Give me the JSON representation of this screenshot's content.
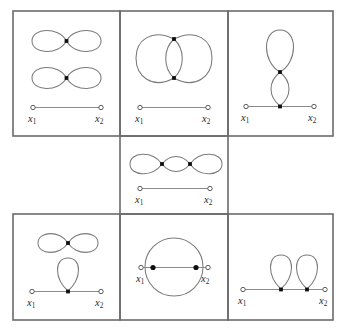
{
  "figure": {
    "background_color": "#ffffff",
    "border_color": "#6b6b6b",
    "curve_color": "#7a7a7a",
    "axis_color": "#8a8a8a",
    "filled_node_color": "#101010",
    "open_node_fill": "#ffffff",
    "open_node_stroke": "#4a4a4a",
    "width": 347,
    "height": 333,
    "grid": {
      "columns": 3,
      "rows": 3,
      "middle_row_occupied_cells": 1
    }
  },
  "labels": {
    "x1": {
      "symbol": "x",
      "subscript": "1"
    },
    "x2": {
      "symbol": "x",
      "subscript": "2"
    }
  },
  "panels": [
    {
      "id": "panel-top-left",
      "position": "row1-col1",
      "description": "Two stacked horizontal figure-eight loops, each with a single node at its crossing point, above an interval with open endpoints.",
      "filled_nodes": 2,
      "loops": 4,
      "axis": {
        "left_label": "x1",
        "right_label": "x2",
        "nodes_on_axis": 0
      }
    },
    {
      "id": "panel-top-middle",
      "position": "row1-col2",
      "description": "Two large vertical ovals meeting at two vertically stacked nodes, above an interval with open endpoints.",
      "filled_nodes": 2,
      "loops": 2,
      "axis": {
        "left_label": "x1",
        "right_label": "x2",
        "nodes_on_axis": 0
      }
    },
    {
      "id": "panel-top-right",
      "position": "row1-col3",
      "description": "Vertical chain: a teardrop loop on top joined at a node to a lens shape whose lower node sits on the interval.",
      "filled_nodes": 2,
      "loops": 2,
      "axis": {
        "left_label": "x1",
        "right_label": "x2",
        "nodes_on_axis": 1
      }
    },
    {
      "id": "panel-middle-center",
      "position": "row2-col2",
      "description": "Horizontal chain of three loops joined at two nodes, above an interval with open endpoints.",
      "filled_nodes": 2,
      "loops": 3,
      "axis": {
        "left_label": "x1",
        "right_label": "x2",
        "nodes_on_axis": 0
      }
    },
    {
      "id": "panel-bottom-left",
      "position": "row3-col1",
      "description": "A detached horizontal figure-eight above a single teardrop loop attached to a node on the interval.",
      "filled_nodes": 2,
      "loops": 3,
      "axis": {
        "left_label": "x1",
        "right_label": "x2",
        "nodes_on_axis": 1
      }
    },
    {
      "id": "panel-bottom-middle",
      "position": "row3-col2",
      "description": "A circle passing through two nodes lying on the interval, centered on the segment.",
      "filled_nodes": 2,
      "loops": 1,
      "axis": {
        "left_label": "x1",
        "right_label": "x2",
        "nodes_on_axis": 2
      }
    },
    {
      "id": "panel-bottom-right",
      "position": "row3-col3",
      "description": "Two teardrop loops, each attached to its own node on the interval.",
      "filled_nodes": 2,
      "loops": 2,
      "axis": {
        "left_label": "x1",
        "right_label": "x2",
        "nodes_on_axis": 2
      }
    }
  ]
}
